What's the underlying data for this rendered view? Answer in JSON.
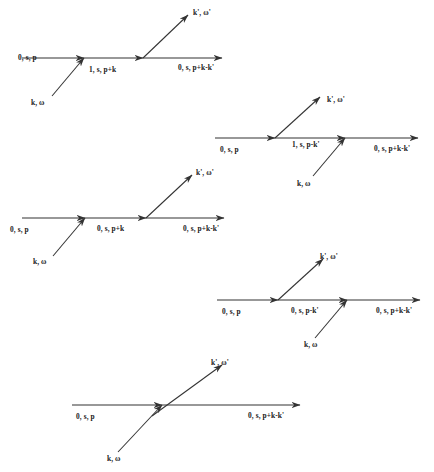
{
  "figure": {
    "background_color": "#ffffff",
    "line_color": "#333333",
    "text_color": "#1a1a1a"
  },
  "diagrams": [
    {
      "id": "diagram-1",
      "labels": {
        "incoming_left": "0, s, p",
        "middle": "1, s, p+k",
        "outgoing_right": "0, s, p+k-k'",
        "outgoing_photon": "k', ω'",
        "incoming_photon": "k, ω"
      }
    },
    {
      "id": "diagram-2",
      "labels": {
        "incoming_left": "0, s, p",
        "middle": "1, s, p-k'",
        "outgoing_right": "0, s, p+k-k'",
        "outgoing_photon": "k', ω'",
        "incoming_photon": "k, ω"
      }
    },
    {
      "id": "diagram-3",
      "labels": {
        "incoming_left": "0, s, p",
        "middle": "0, s, p+k",
        "outgoing_right": "0, s, p+k-k'",
        "outgoing_photon": "k', ω'",
        "incoming_photon": "k, ω"
      }
    },
    {
      "id": "diagram-4",
      "labels": {
        "incoming_left": "0, s, p",
        "middle": "0, s, p-k'",
        "outgoing_right": "0, s, p+k-k'",
        "outgoing_photon": "k', ω'",
        "incoming_photon": "k, ω"
      }
    },
    {
      "id": "diagram-5",
      "labels": {
        "incoming_left": "0, s, p",
        "outgoing_right": "0, s, p+k-k'",
        "outgoing_photon": "k', ω'",
        "incoming_photon": "k, ω"
      }
    }
  ]
}
